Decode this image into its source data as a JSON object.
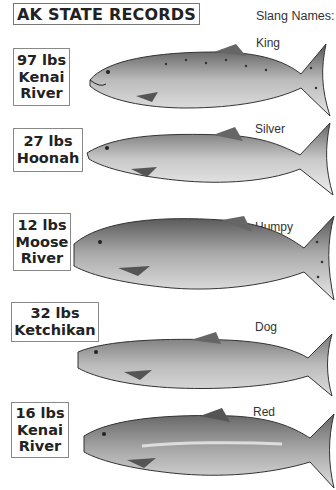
{
  "title": "AK STATE RECORDS",
  "slang_header": "Slang Names:",
  "fish": [
    {
      "weight": "97 lbs",
      "location_line1": "Kenai",
      "location_line2": "River",
      "slang": "King"
    },
    {
      "weight": "27 lbs",
      "location_line1": "Hoonah",
      "location_line2": "",
      "slang": "Silver"
    },
    {
      "weight": "12 lbs",
      "location_line1": "Moose",
      "location_line2": "River",
      "slang": "Humpy"
    },
    {
      "weight": "32 lbs",
      "location_line1": "Ketchikan",
      "location_line2": "",
      "slang": "Dog"
    },
    {
      "weight": "16 lbs",
      "location_line1": "Kenai",
      "location_line2": "River",
      "slang": "Red"
    }
  ],
  "colors": {
    "fish_dark": "#4a4a4a",
    "fish_mid": "#9a9a9a",
    "fish_light": "#d8d8d8",
    "border": "#888888"
  }
}
